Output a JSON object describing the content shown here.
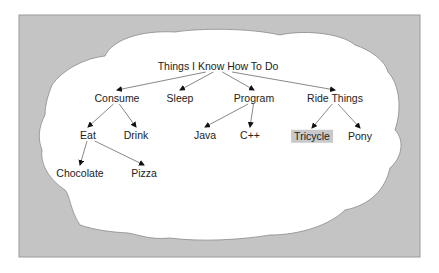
{
  "diagram": {
    "type": "tree",
    "background_color": "#c4c4c4",
    "cloud_color": "#ffffff",
    "highlight_color": "#c9c9c9",
    "root": {
      "id": "root",
      "label": "Things I Know How To Do"
    },
    "nodes": [
      {
        "id": "root",
        "label": "Things I Know How To Do",
        "x": 218,
        "y": 66
      },
      {
        "id": "consume",
        "label": "Consume",
        "x": 117,
        "y": 98
      },
      {
        "id": "sleep",
        "label": "Sleep",
        "x": 180,
        "y": 98
      },
      {
        "id": "program",
        "label": "Program",
        "x": 254,
        "y": 98
      },
      {
        "id": "ride",
        "label": "Ride Things",
        "x": 335,
        "y": 98
      },
      {
        "id": "eat",
        "label": "Eat",
        "x": 88,
        "y": 135
      },
      {
        "id": "drink",
        "label": "Drink",
        "x": 136,
        "y": 135
      },
      {
        "id": "java",
        "label": "Java",
        "x": 205,
        "y": 135
      },
      {
        "id": "cpp",
        "label": "C++",
        "x": 250,
        "y": 135
      },
      {
        "id": "tricycle",
        "label": "Tricycle",
        "x": 312,
        "y": 136,
        "highlighted": true
      },
      {
        "id": "pony",
        "label": "Pony",
        "x": 360,
        "y": 136
      },
      {
        "id": "chocolate",
        "label": "Chocolate",
        "x": 80,
        "y": 173
      },
      {
        "id": "pizza",
        "label": "Pizza",
        "x": 144,
        "y": 173
      }
    ],
    "edges": [
      {
        "from": "root",
        "to": "consume"
      },
      {
        "from": "root",
        "to": "sleep"
      },
      {
        "from": "root",
        "to": "program"
      },
      {
        "from": "root",
        "to": "ride"
      },
      {
        "from": "consume",
        "to": "eat"
      },
      {
        "from": "consume",
        "to": "drink"
      },
      {
        "from": "program",
        "to": "java"
      },
      {
        "from": "program",
        "to": "cpp"
      },
      {
        "from": "ride",
        "to": "tricycle"
      },
      {
        "from": "ride",
        "to": "pony"
      },
      {
        "from": "eat",
        "to": "chocolate"
      },
      {
        "from": "eat",
        "to": "pizza"
      }
    ]
  }
}
